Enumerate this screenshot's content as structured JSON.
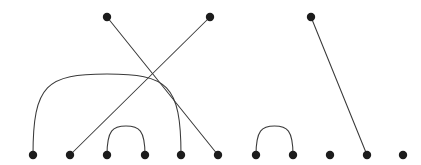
{
  "figure": {
    "title": "",
    "type": "chord-arc-node-link-diagram",
    "width": 421,
    "height": 165,
    "background_color": "#ffffff"
  },
  "style": {
    "node_color": "#1c1c1c",
    "node_radius": 4.2,
    "edge_color": "#3a3a3a",
    "edge_width": 1.05
  },
  "chart_data": {
    "type": "scatter",
    "title": "",
    "xlabel": "",
    "ylabel": "",
    "xlim": [
      0,
      421
    ],
    "ylim": [
      165,
      0
    ],
    "grid": false,
    "legend": "none",
    "nodes": [
      {
        "id": "b1",
        "x": 33,
        "y": 155,
        "row": "bottom"
      },
      {
        "id": "b2",
        "x": 70,
        "y": 155,
        "row": "bottom"
      },
      {
        "id": "b3",
        "x": 107,
        "y": 155,
        "row": "bottom"
      },
      {
        "id": "b4",
        "x": 145,
        "y": 155,
        "row": "bottom"
      },
      {
        "id": "b5",
        "x": 181,
        "y": 155,
        "row": "bottom"
      },
      {
        "id": "b6",
        "x": 218,
        "y": 155,
        "row": "bottom"
      },
      {
        "id": "b7",
        "x": 256,
        "y": 155,
        "row": "bottom"
      },
      {
        "id": "b8",
        "x": 293,
        "y": 155,
        "row": "bottom"
      },
      {
        "id": "b9",
        "x": 330,
        "y": 155,
        "row": "bottom"
      },
      {
        "id": "b10",
        "x": 367,
        "y": 155,
        "row": "bottom"
      },
      {
        "id": "b11",
        "x": 403,
        "y": 155,
        "row": "bottom"
      },
      {
        "id": "t1",
        "x": 107,
        "y": 17,
        "row": "top"
      },
      {
        "id": "t2",
        "x": 210,
        "y": 17,
        "row": "top"
      },
      {
        "id": "t3",
        "x": 311,
        "y": 17,
        "row": "top"
      }
    ],
    "edges": [
      {
        "id": "e1",
        "kind": "arc",
        "source": "b1",
        "target": "b5",
        "apex_y": 74,
        "d": "M 33 155 C 33 84 47 74 107 74 C 167 74 181 84 181 155"
      },
      {
        "id": "e2",
        "kind": "arc",
        "source": "b3",
        "target": "b4",
        "apex_y": 133,
        "d": "M 107 155 C 107 130 113 126 126 126 C 139 126 145 130 145 155"
      },
      {
        "id": "e3",
        "kind": "arc",
        "source": "b7",
        "target": "b8",
        "apex_y": 133,
        "d": "M 256 155 C 256 130 262 126 274.5 126 C 287 126 293 130 293 155"
      },
      {
        "id": "e4",
        "kind": "straight",
        "source": "t1",
        "target": "b6",
        "d": "M 107 17 L 218 155"
      },
      {
        "id": "e5",
        "kind": "straight",
        "source": "t2",
        "target": "b2",
        "d": "M 210 17 L 70 155"
      },
      {
        "id": "e6",
        "kind": "straight",
        "source": "t3",
        "target": "b10",
        "d": "M 311 17 L 367 155"
      }
    ],
    "node_count": 14,
    "edge_count": 6,
    "isolated_nodes": [
      "b9",
      "b11"
    ]
  }
}
